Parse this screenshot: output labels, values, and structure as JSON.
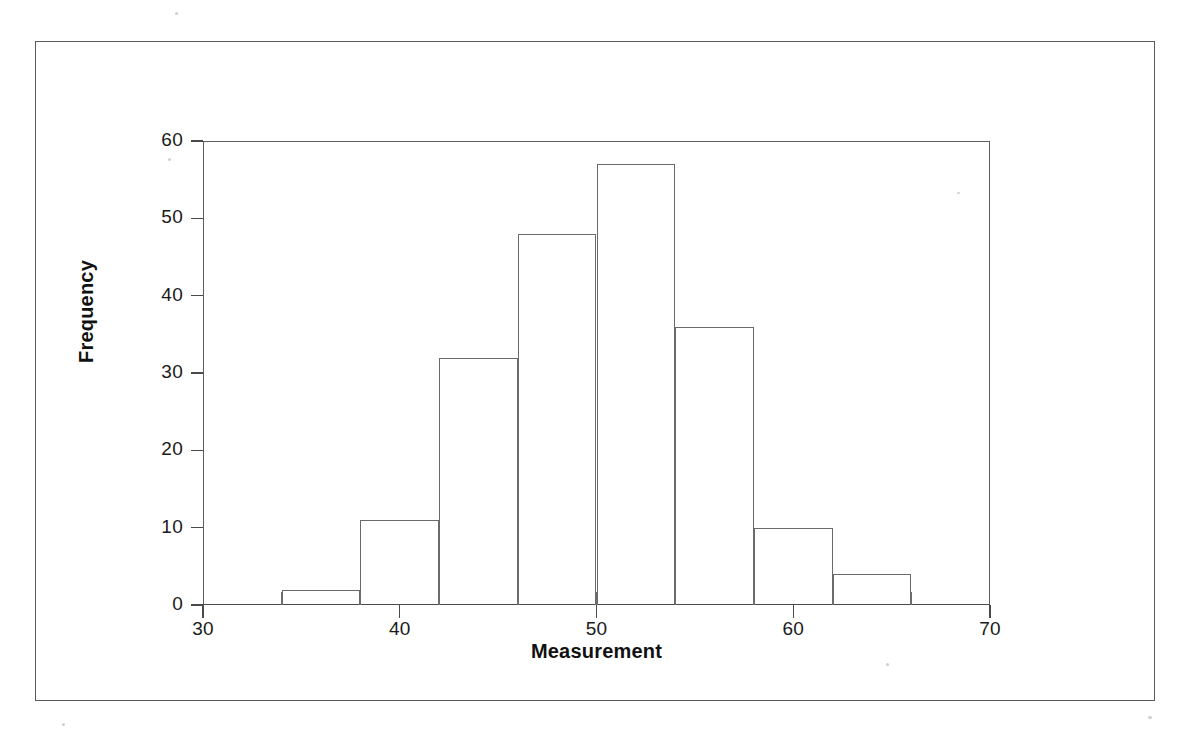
{
  "figure": {
    "kind": "scanned-histogram-figure",
    "background_color": "#ffffff",
    "ink_color": "#4a4a4a",
    "page_border_color": "#5a5a5a"
  },
  "chart_data": {
    "type": "bar",
    "subtype": "histogram",
    "title": "",
    "xlabel": "Measurement",
    "ylabel": "Frequency",
    "xlim": [
      30,
      70
    ],
    "ylim": [
      0,
      60
    ],
    "grid": false,
    "legend": false,
    "bin_width": 4,
    "bin_edges": [
      34,
      38,
      42,
      46,
      50,
      54,
      58,
      62,
      66
    ],
    "categories": [
      "34-38",
      "38-42",
      "42-46",
      "46-50",
      "50-54",
      "54-58",
      "58-62",
      "62-66"
    ],
    "bin_centers": [
      36,
      40,
      44,
      48,
      52,
      56,
      60,
      64
    ],
    "values": [
      2,
      11,
      32,
      48,
      57,
      36,
      10,
      4
    ],
    "xticks": [
      30,
      40,
      50,
      60,
      70
    ],
    "xtick_labels": [
      "30",
      "40",
      "50",
      "60",
      "70"
    ],
    "yticks": [
      0,
      10,
      20,
      30,
      40,
      50,
      60
    ],
    "ytick_labels": [
      "0",
      "10",
      "20",
      "30",
      "40",
      "50",
      "60"
    ],
    "bar_fill": "none",
    "bar_edge_color": "#6a6a6a"
  }
}
